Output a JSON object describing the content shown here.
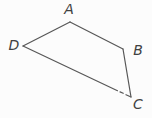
{
  "figure": {
    "type": "geometry-diagram",
    "background_color": "#fcfcfc",
    "line_color": "#575757",
    "label_color": "#414141",
    "stroke_width": 1.2,
    "vertices": [
      {
        "id": "A",
        "label": "A",
        "x": 70,
        "y": 22,
        "label_x": 69,
        "label_y": 9
      },
      {
        "id": "B",
        "label": "B",
        "x": 123,
        "y": 49,
        "label_x": 138,
        "label_y": 50
      },
      {
        "id": "C",
        "label": "C",
        "x": 131,
        "y": 97,
        "label_x": 138,
        "label_y": 104
      },
      {
        "id": "D",
        "label": "D",
        "x": 23,
        "y": 46,
        "label_x": 14,
        "label_y": 45
      }
    ],
    "edges": [
      {
        "from": "A",
        "to": "B"
      },
      {
        "from": "B",
        "to": "C"
      },
      {
        "from": "D",
        "to": "A"
      },
      {
        "from": "D",
        "to": "C",
        "note": "edge has a small print gap near C",
        "segments": [
          [
            23,
            46,
            117.5,
            90.7
          ],
          [
            120,
            91.9,
            123.2,
            93.3
          ],
          [
            126,
            94.7,
            131,
            97
          ]
        ]
      }
    ]
  }
}
